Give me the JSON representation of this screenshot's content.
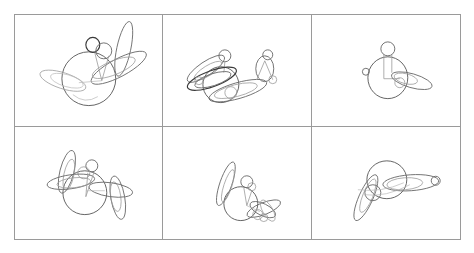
{
  "figure": {
    "layout": {
      "rows": 2,
      "columns": 3,
      "panel_count": 6
    },
    "canvas": {
      "width": 474,
      "height": 253,
      "background": "#ffffff"
    },
    "style": {
      "panel_border_color": "#9a9a9a",
      "stroke_dark": "#3a3a3a",
      "stroke_mid": "#6e6e6e",
      "stroke_base": "#555555",
      "stroke_light": "#9b9b9b",
      "stroke_faint": "#b8b8b8"
    }
  },
  "panels": [
    {
      "id": "panel-1",
      "position": "row-1-col-1",
      "description": "Figure with large body circle, small head circle and crossing elongated ellipses to the right and lower left",
      "shape_count": 12,
      "shapes": [
        {
          "name": "body-circle",
          "type": "ellipse",
          "cx": 88,
          "cy": 78,
          "rx": 27,
          "ry": 27,
          "rot": 0,
          "tone": "base"
        },
        {
          "name": "head-circle",
          "type": "ellipse",
          "cx": 92,
          "cy": 44,
          "rx": 7,
          "ry": 7.5,
          "rot": 0,
          "tone": "dark"
        },
        {
          "name": "neck-circle",
          "type": "ellipse",
          "cx": 103,
          "cy": 50,
          "rx": 8,
          "ry": 8,
          "rot": 0,
          "tone": "mid"
        },
        {
          "name": "right-blade-ellipse",
          "type": "ellipse",
          "cx": 123,
          "cy": 48,
          "rx": 7,
          "ry": 28,
          "rot": 12,
          "tone": "mid"
        },
        {
          "name": "right-wing-ellipse",
          "type": "ellipse",
          "cx": 118,
          "cy": 67,
          "rx": 31,
          "ry": 9,
          "rot": -28,
          "tone": "mid"
        },
        {
          "name": "right-wing-inner",
          "type": "ellipse",
          "cx": 113,
          "cy": 67,
          "rx": 23,
          "ry": 7,
          "rot": -22,
          "tone": "light"
        },
        {
          "name": "left-wing-ellipse",
          "type": "ellipse",
          "cx": 62,
          "cy": 80,
          "rx": 24,
          "ry": 8,
          "rot": 18,
          "tone": "light"
        },
        {
          "name": "left-wing-inner",
          "type": "ellipse",
          "cx": 66,
          "cy": 80,
          "rx": 17,
          "ry": 6,
          "rot": 16,
          "tone": "faint"
        },
        {
          "name": "torso-line-left",
          "type": "line",
          "x1": 94,
          "y1": 52,
          "x2": 101,
          "y2": 80,
          "tone": "light"
        },
        {
          "name": "torso-line-right",
          "type": "line",
          "x1": 108,
          "y1": 55,
          "x2": 101,
          "y2": 80,
          "tone": "light"
        },
        {
          "name": "arm-line",
          "type": "line",
          "x1": 101,
          "y1": 80,
          "x2": 78,
          "y2": 82,
          "tone": "faint"
        },
        {
          "name": "lower-arc",
          "type": "path",
          "d": "M 72 94 Q 84 104 97 96",
          "tone": "faint"
        }
      ]
    },
    {
      "id": "panel-2",
      "position": "row-1-col-2",
      "description": "Two figures: dense overlapping ellipse cluster on the left, small separate ellipse-and-circle figure on the right",
      "shape_count": 16,
      "shapes": [
        {
          "name": "body-circle",
          "type": "ellipse",
          "cx": 221,
          "cy": 84,
          "rx": 18,
          "ry": 18,
          "rot": 0,
          "tone": "base"
        },
        {
          "name": "head-circle",
          "type": "ellipse",
          "cx": 225,
          "cy": 55,
          "rx": 6,
          "ry": 6,
          "rot": 0,
          "tone": "mid"
        },
        {
          "name": "neck-line",
          "type": "line",
          "x1": 225,
          "y1": 61,
          "x2": 224,
          "y2": 72,
          "tone": "light"
        },
        {
          "name": "upper-wing-ellipse",
          "type": "ellipse",
          "cx": 206,
          "cy": 68,
          "rx": 22,
          "ry": 7,
          "rot": -34,
          "tone": "mid"
        },
        {
          "name": "upper-wing-inner",
          "type": "ellipse",
          "cx": 208,
          "cy": 70,
          "rx": 16,
          "ry": 5,
          "rot": -32,
          "tone": "light"
        },
        {
          "name": "mid-wing-ellipse",
          "type": "ellipse",
          "cx": 212,
          "cy": 78,
          "rx": 26,
          "ry": 8,
          "rot": -20,
          "tone": "dark"
        },
        {
          "name": "mid-wing-inner",
          "type": "ellipse",
          "cx": 213,
          "cy": 79,
          "rx": 19,
          "ry": 6,
          "rot": -18,
          "tone": "mid"
        },
        {
          "name": "long-wing-ellipse",
          "type": "ellipse",
          "cx": 238,
          "cy": 90,
          "rx": 30,
          "ry": 8,
          "rot": -16,
          "tone": "mid"
        },
        {
          "name": "long-wing-inner",
          "type": "ellipse",
          "cx": 236,
          "cy": 90,
          "rx": 22,
          "ry": 6,
          "rot": -14,
          "tone": "light"
        },
        {
          "name": "small-joint-circle",
          "type": "ellipse",
          "cx": 199,
          "cy": 80,
          "rx": 4,
          "ry": 4,
          "rot": 0,
          "tone": "light"
        },
        {
          "name": "hip-circle",
          "type": "ellipse",
          "cx": 231,
          "cy": 92,
          "rx": 6,
          "ry": 6,
          "rot": 0,
          "tone": "light"
        },
        {
          "name": "sec-head-circle",
          "type": "ellipse",
          "cx": 268,
          "cy": 54,
          "rx": 5,
          "ry": 5,
          "rot": 0,
          "tone": "mid"
        },
        {
          "name": "sec-body-ellipse",
          "type": "ellipse",
          "cx": 265,
          "cy": 68,
          "rx": 9,
          "ry": 13,
          "rot": 0,
          "tone": "mid"
        },
        {
          "name": "sec-leg-left-line",
          "type": "line",
          "x1": 265,
          "y1": 60,
          "x2": 257,
          "y2": 79,
          "tone": "light"
        },
        {
          "name": "sec-leg-right-line",
          "type": "line",
          "x1": 265,
          "y1": 60,
          "x2": 273,
          "y2": 79,
          "tone": "light"
        },
        {
          "name": "sec-foot-circle",
          "type": "ellipse",
          "cx": 273,
          "cy": 79,
          "rx": 4,
          "ry": 4,
          "rot": 0,
          "tone": "light"
        }
      ]
    },
    {
      "id": "panel-3",
      "position": "row-1-col-3",
      "description": "Sparse figure: body circle with head circle above, narrow pointed ellipse to the right, small detached circle at left",
      "shape_count": 9,
      "shapes": [
        {
          "name": "body-circle",
          "type": "ellipse",
          "cx": 388,
          "cy": 77,
          "rx": 20,
          "ry": 21,
          "rot": 0,
          "tone": "base"
        },
        {
          "name": "head-circle",
          "type": "ellipse",
          "cx": 388,
          "cy": 48,
          "rx": 7,
          "ry": 7,
          "rot": 0,
          "tone": "mid"
        },
        {
          "name": "neck-line-left",
          "type": "line",
          "x1": 384,
          "y1": 54,
          "x2": 384,
          "y2": 78,
          "tone": "light"
        },
        {
          "name": "neck-line-right",
          "type": "line",
          "x1": 392,
          "y1": 54,
          "x2": 392,
          "y2": 72,
          "tone": "light"
        },
        {
          "name": "shoulder-line",
          "type": "line",
          "x1": 384,
          "y1": 78,
          "x2": 400,
          "y2": 78,
          "tone": "light"
        },
        {
          "name": "arm-ellipse",
          "type": "ellipse",
          "cx": 412,
          "cy": 80,
          "rx": 21,
          "ry": 7,
          "rot": 16,
          "tone": "mid"
        },
        {
          "name": "arm-inner-ellipse",
          "type": "ellipse",
          "cx": 406,
          "cy": 78,
          "rx": 12,
          "ry": 5,
          "rot": 14,
          "tone": "light"
        },
        {
          "name": "hand-circle",
          "type": "ellipse",
          "cx": 400,
          "cy": 82,
          "rx": 5,
          "ry": 5,
          "rot": 0,
          "tone": "light"
        },
        {
          "name": "detached-circle",
          "type": "ellipse",
          "cx": 366,
          "cy": 71,
          "rx": 3.5,
          "ry": 3.5,
          "rot": 0,
          "tone": "mid"
        }
      ]
    },
    {
      "id": "panel-4",
      "position": "row-2-col-1",
      "description": "Figure with body circle flanked by near-vertical elongated ellipses on both sides and a small head circle",
      "shape_count": 13,
      "shapes": [
        {
          "name": "body-circle",
          "type": "ellipse",
          "cx": 84,
          "cy": 192,
          "rx": 22,
          "ry": 22,
          "rot": 0,
          "tone": "base"
        },
        {
          "name": "head-circle",
          "type": "ellipse",
          "cx": 91,
          "cy": 165,
          "rx": 6,
          "ry": 6,
          "rot": 0,
          "tone": "mid"
        },
        {
          "name": "neck-circle",
          "type": "ellipse",
          "cx": 83,
          "cy": 172,
          "rx": 6,
          "ry": 6,
          "rot": 0,
          "tone": "light"
        },
        {
          "name": "left-blade-outer",
          "type": "ellipse",
          "cx": 66,
          "cy": 171,
          "rx": 7,
          "ry": 22,
          "rot": 14,
          "tone": "mid"
        },
        {
          "name": "left-blade-inner",
          "type": "ellipse",
          "cx": 68,
          "cy": 174,
          "rx": 5,
          "ry": 16,
          "rot": 12,
          "tone": "light"
        },
        {
          "name": "left-wing-ellipse",
          "type": "ellipse",
          "cx": 70,
          "cy": 181,
          "rx": 24,
          "ry": 7,
          "rot": -8,
          "tone": "mid"
        },
        {
          "name": "left-wing-inner",
          "type": "ellipse",
          "cx": 73,
          "cy": 182,
          "rx": 17,
          "ry": 5,
          "rot": -6,
          "tone": "light"
        },
        {
          "name": "right-blade-outer",
          "type": "ellipse",
          "cx": 117,
          "cy": 197,
          "rx": 7,
          "ry": 22,
          "rot": -10,
          "tone": "mid"
        },
        {
          "name": "right-blade-inner",
          "type": "ellipse",
          "cx": 115,
          "cy": 196,
          "rx": 5,
          "ry": 15,
          "rot": -8,
          "tone": "light"
        },
        {
          "name": "right-wing-ellipse",
          "type": "ellipse",
          "cx": 110,
          "cy": 189,
          "rx": 22,
          "ry": 7,
          "rot": 8,
          "tone": "mid"
        },
        {
          "name": "torso-line-left",
          "type": "line",
          "x1": 87,
          "y1": 172,
          "x2": 85,
          "y2": 196,
          "tone": "light"
        },
        {
          "name": "torso-line-right",
          "type": "line",
          "x1": 93,
          "y1": 172,
          "x2": 85,
          "y2": 196,
          "tone": "light"
        },
        {
          "name": "shoulder-line",
          "type": "line",
          "x1": 85,
          "y1": 190,
          "x2": 104,
          "y2": 190,
          "tone": "faint"
        }
      ]
    },
    {
      "id": "panel-5",
      "position": "row-2-col-2",
      "description": "Figure with tall slanted ellipse at upper left, body circle, small head circles and a cluster of crossed ellipses at lower right",
      "shape_count": 13,
      "shapes": [
        {
          "name": "body-circle",
          "type": "ellipse",
          "cx": 241,
          "cy": 203,
          "rx": 17,
          "ry": 17,
          "rot": 0,
          "tone": "base"
        },
        {
          "name": "head-circle",
          "type": "ellipse",
          "cx": 247,
          "cy": 181,
          "rx": 6,
          "ry": 6,
          "rot": 0,
          "tone": "mid"
        },
        {
          "name": "head-inner-circle",
          "type": "ellipse",
          "cx": 252,
          "cy": 186,
          "rx": 4,
          "ry": 4,
          "rot": 0,
          "tone": "light"
        },
        {
          "name": "tall-blade-ellipse",
          "type": "ellipse",
          "cx": 226,
          "cy": 183,
          "rx": 6,
          "ry": 23,
          "rot": 19,
          "tone": "mid"
        },
        {
          "name": "tall-blade-inner",
          "type": "ellipse",
          "cx": 228,
          "cy": 185,
          "rx": 4,
          "ry": 17,
          "rot": 18,
          "tone": "light"
        },
        {
          "name": "right-wing-a",
          "type": "ellipse",
          "cx": 264,
          "cy": 208,
          "rx": 18,
          "ry": 6,
          "rot": -22,
          "tone": "mid"
        },
        {
          "name": "right-wing-b",
          "type": "ellipse",
          "cx": 263,
          "cy": 209,
          "rx": 14,
          "ry": 6,
          "rot": 26,
          "tone": "mid"
        },
        {
          "name": "right-wing-c",
          "type": "ellipse",
          "cx": 268,
          "cy": 210,
          "rx": 12,
          "ry": 5,
          "rot": 60,
          "tone": "light"
        },
        {
          "name": "knee-circle",
          "type": "ellipse",
          "cx": 258,
          "cy": 214,
          "rx": 5,
          "ry": 5,
          "rot": 0,
          "tone": "light"
        },
        {
          "name": "foot-circle",
          "type": "ellipse",
          "cx": 264,
          "cy": 217,
          "rx": 4,
          "ry": 4,
          "rot": 0,
          "tone": "light"
        },
        {
          "name": "torso-line-left",
          "type": "line",
          "x1": 244,
          "y1": 187,
          "x2": 247,
          "y2": 205,
          "tone": "light"
        },
        {
          "name": "torso-line-right",
          "type": "line",
          "x1": 252,
          "y1": 190,
          "x2": 247,
          "y2": 205,
          "tone": "light"
        },
        {
          "name": "hip-line",
          "type": "line",
          "x1": 247,
          "y1": 205,
          "x2": 260,
          "y2": 211,
          "tone": "faint"
        }
      ]
    },
    {
      "id": "panel-6",
      "position": "row-2-col-3",
      "description": "Reclining figure: large body circle, long horizontal ellipse to the right ending in a small circle, long slanted ellipse to the lower left",
      "shape_count": 9,
      "shapes": [
        {
          "name": "body-circle",
          "type": "ellipse",
          "cx": 387,
          "cy": 179,
          "rx": 20,
          "ry": 19,
          "rot": 0,
          "tone": "base"
        },
        {
          "name": "long-arm-ellipse",
          "type": "ellipse",
          "cx": 411,
          "cy": 182,
          "rx": 28,
          "ry": 8,
          "rot": -4,
          "tone": "mid"
        },
        {
          "name": "long-arm-inner",
          "type": "ellipse",
          "cx": 405,
          "cy": 183,
          "rx": 18,
          "ry": 6,
          "rot": -4,
          "tone": "light"
        },
        {
          "name": "hand-circle",
          "type": "ellipse",
          "cx": 436,
          "cy": 180,
          "rx": 4.5,
          "ry": 4.5,
          "rot": 0,
          "tone": "mid"
        },
        {
          "name": "leg-ellipse",
          "type": "ellipse",
          "cx": 366,
          "cy": 197,
          "rx": 7,
          "ry": 25,
          "rot": 24,
          "tone": "mid"
        },
        {
          "name": "leg-inner-ellipse",
          "type": "ellipse",
          "cx": 368,
          "cy": 195,
          "rx": 5,
          "ry": 18,
          "rot": 22,
          "tone": "light"
        },
        {
          "name": "knee-circle",
          "type": "ellipse",
          "cx": 373,
          "cy": 192,
          "rx": 8,
          "ry": 8,
          "rot": 0,
          "tone": "mid"
        },
        {
          "name": "sweep-curve",
          "type": "path",
          "d": "M 358 189 Q 382 192 404 182",
          "tone": "faint"
        },
        {
          "name": "sweep-curve-2",
          "type": "path",
          "d": "M 364 194 Q 386 197 410 184",
          "tone": "faint"
        }
      ]
    }
  ]
}
